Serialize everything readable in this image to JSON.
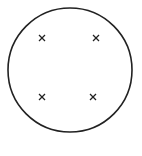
{
  "diagram": {
    "circle": {
      "cx": 70,
      "cy": 70,
      "r": 62,
      "stroke": "#222222"
    },
    "marks": [
      {
        "symbol": "×",
        "x": 42,
        "y": 38
      },
      {
        "symbol": "×",
        "x": 96,
        "y": 38
      },
      {
        "symbol": "×",
        "x": 42,
        "y": 97
      },
      {
        "symbol": "×",
        "x": 93,
        "y": 97
      }
    ]
  }
}
